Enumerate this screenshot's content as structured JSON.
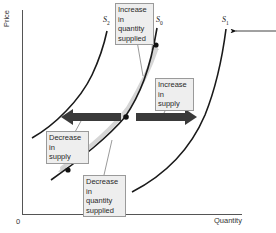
{
  "diagram": {
    "type": "supply-shift-diagram",
    "axes": {
      "y_label": "Price",
      "x_label": "Quantity",
      "origin_label": "0"
    },
    "curves": [
      {
        "id": "S2",
        "name": "S",
        "subscript": "2",
        "color": "#1a1a1a"
      },
      {
        "id": "S0",
        "name": "S",
        "subscript": "0",
        "color": "#1a1a1a"
      },
      {
        "id": "S1",
        "name": "S",
        "subscript": "1",
        "color": "#1a1a1a"
      }
    ],
    "annotations": {
      "increase_qs": "Increase in quantity supplied",
      "increase_qs_lines": [
        "Increase in",
        "quantity",
        "supplied"
      ],
      "increase_supply_lines": [
        "Increase in",
        "supply"
      ],
      "decrease_supply_lines": [
        "Decrease in",
        "supply"
      ],
      "decrease_qs_lines": [
        "Decrease in",
        "quantity",
        "supplied"
      ]
    },
    "colors": {
      "arrow": "#3a3a3a",
      "movement_highlight": "#d8d8d8",
      "label_bg": "#eeeeee",
      "label_border": "#9a9a9a",
      "axis": "#555555"
    }
  }
}
